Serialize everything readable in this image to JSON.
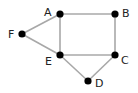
{
  "diagram": {
    "type": "undirected-graph",
    "colors": {
      "edge": "#a8a8a8",
      "node": "#000000",
      "label": "#222222"
    },
    "nodes": [
      {
        "id": "A",
        "label": "A",
        "x": 60,
        "y": 14,
        "lx": 44,
        "ly": 16
      },
      {
        "id": "B",
        "label": "B",
        "x": 115,
        "y": 14,
        "lx": 122,
        "ly": 17
      },
      {
        "id": "C",
        "label": "C",
        "x": 115,
        "y": 55,
        "lx": 121,
        "ly": 64
      },
      {
        "id": "D",
        "label": "D",
        "x": 88,
        "y": 81,
        "lx": 95,
        "ly": 87
      },
      {
        "id": "E",
        "label": "E",
        "x": 60,
        "y": 55,
        "lx": 45,
        "ly": 65
      },
      {
        "id": "F",
        "label": "F",
        "x": 22,
        "y": 34,
        "lx": 8,
        "ly": 38
      }
    ],
    "edges": [
      [
        "A",
        "B"
      ],
      [
        "B",
        "C"
      ],
      [
        "A",
        "E"
      ],
      [
        "E",
        "C"
      ],
      [
        "A",
        "F"
      ],
      [
        "F",
        "E"
      ],
      [
        "E",
        "D"
      ],
      [
        "D",
        "C"
      ]
    ]
  }
}
